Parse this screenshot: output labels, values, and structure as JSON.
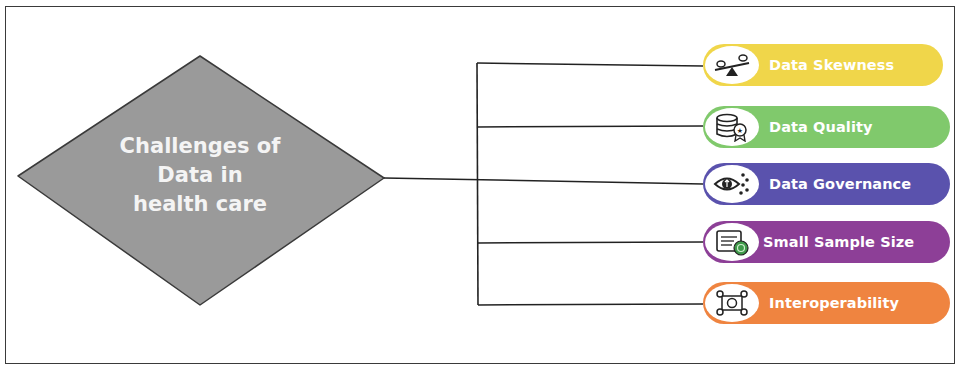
{
  "diagram": {
    "center_node": {
      "lines": [
        "Challenges of",
        "Data in",
        "health care"
      ],
      "fill": "#9a9a9a",
      "stroke": "#3a3a3a"
    },
    "branches": [
      {
        "label": "Data Skewness",
        "icon": "seesaw-balance-icon",
        "color": "#f0d64a"
      },
      {
        "label": "Data Quality",
        "icon": "database-award-icon",
        "color": "#80c96c"
      },
      {
        "label": "Data Governance",
        "icon": "eye-shield-icon",
        "color": "#5a52ad"
      },
      {
        "label": "Small Sample Size",
        "icon": "document-shield-icon",
        "color": "#8d3f97"
      },
      {
        "label": "Interoperability",
        "icon": "connected-nodes-icon",
        "color": "#ef8440"
      }
    ],
    "connector_color": "#222222"
  }
}
